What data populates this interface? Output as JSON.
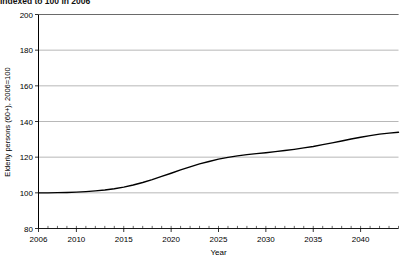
{
  "caption": {
    "text": "Indexed to 100 in 2006"
  },
  "chart_data": {
    "type": "line",
    "title": "",
    "subtitle": "Indexed to 100 in 2006",
    "xlabel": "Year",
    "ylabel": "Elderly persons (60+), 2006=100",
    "xlim": [
      2006,
      2044
    ],
    "ylim": [
      80,
      200
    ],
    "yticks": [
      80,
      100,
      120,
      140,
      160,
      180,
      200
    ],
    "ytick_labels": [
      "80",
      "100",
      "120",
      "140",
      "160",
      "180",
      "200"
    ],
    "xticks": [
      2006,
      2010,
      2015,
      2020,
      2025,
      2030,
      2035,
      2040
    ],
    "xtick_labels": [
      "2006",
      "2010",
      "2015",
      "2020",
      "2025",
      "2030",
      "2035",
      "2040"
    ],
    "minor_xticks_every": 1,
    "grid": "horizontal",
    "grid_color": "#999999",
    "legend": "none",
    "series": [
      {
        "name": "Elderly persons (60+)",
        "color": "#000000",
        "line_width": 1.4,
        "x": [
          2006,
          2007,
          2008,
          2009,
          2010,
          2011,
          2012,
          2013,
          2014,
          2015,
          2016,
          2017,
          2018,
          2019,
          2020,
          2021,
          2022,
          2023,
          2024,
          2025,
          2026,
          2027,
          2028,
          2029,
          2030,
          2031,
          2032,
          2033,
          2034,
          2035,
          2036,
          2037,
          2038,
          2039,
          2040,
          2041,
          2042,
          2043,
          2044
        ],
        "values": [
          100.0,
          100.0,
          100.1,
          100.2,
          100.4,
          100.7,
          101.1,
          101.6,
          102.3,
          103.2,
          104.4,
          105.8,
          107.4,
          109.2,
          111.0,
          112.9,
          114.6,
          116.2,
          117.6,
          118.9,
          119.9,
          120.7,
          121.4,
          122.0,
          122.5,
          123.1,
          123.7,
          124.4,
          125.2,
          126.0,
          127.0,
          128.0,
          129.1,
          130.2,
          131.2,
          132.1,
          132.9,
          133.5,
          134.0
        ]
      }
    ]
  }
}
